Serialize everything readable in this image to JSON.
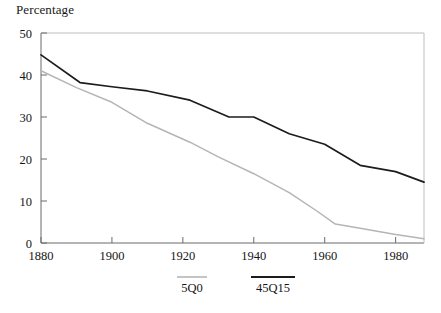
{
  "chart_data": {
    "type": "line",
    "title": "",
    "ylabel": "Percentage",
    "xlabel": "",
    "xlim": [
      1880,
      1988
    ],
    "ylim": [
      0,
      50
    ],
    "grid": false,
    "legend_position": "bottom",
    "xticks": [
      1880,
      1900,
      1920,
      1940,
      1960,
      1980
    ],
    "yticks": [
      0,
      10,
      20,
      30,
      40,
      50
    ],
    "series": [
      {
        "name": "5Q0",
        "color": "#b5b5b5",
        "x": [
          1880,
          1890,
          1900,
          1910,
          1922,
          1930,
          1940,
          1950,
          1958,
          1963,
          1970,
          1980,
          1988
        ],
        "values": [
          41,
          37,
          33.5,
          28.5,
          24,
          20.5,
          16.5,
          12,
          7.5,
          4.5,
          3.5,
          2,
          1
        ]
      },
      {
        "name": "45Q15",
        "color": "#1c1c1c",
        "x": [
          1880,
          1891,
          1900,
          1910,
          1922,
          1933,
          1940,
          1950,
          1960,
          1970,
          1980,
          1988
        ],
        "values": [
          44.8,
          38.2,
          37.2,
          36.2,
          34,
          30,
          30,
          26,
          23.5,
          18.5,
          17,
          14.5
        ]
      }
    ]
  },
  "ytick_labels": [
    "0",
    "10",
    "20",
    "30",
    "40",
    "50"
  ],
  "xtick_labels": [
    "1880",
    "1900",
    "1920",
    "1940",
    "1960",
    "1980"
  ],
  "legend": {
    "items": [
      {
        "label": "5Q0"
      },
      {
        "label": "45Q15"
      }
    ]
  }
}
